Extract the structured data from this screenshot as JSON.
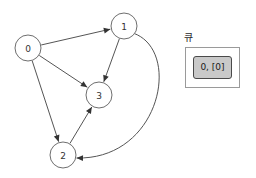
{
  "graph": {
    "directed": true,
    "nodes": [
      {
        "id": "0",
        "label": "0",
        "cx": 28,
        "cy": 48,
        "r": 13
      },
      {
        "id": "1",
        "label": "1",
        "cx": 124,
        "cy": 26,
        "r": 13
      },
      {
        "id": "3",
        "label": "3",
        "cx": 99,
        "cy": 95,
        "r": 13
      },
      {
        "id": "2",
        "label": "2",
        "cx": 63,
        "cy": 155,
        "r": 13
      }
    ],
    "edges": [
      {
        "from": "0",
        "to": "1",
        "curved": false
      },
      {
        "from": "0",
        "to": "3",
        "curved": false
      },
      {
        "from": "0",
        "to": "2",
        "curved": false
      },
      {
        "from": "1",
        "to": "3",
        "curved": false
      },
      {
        "from": "2",
        "to": "3",
        "curved": false
      },
      {
        "from": "1",
        "to": "2",
        "curved": true
      }
    ]
  },
  "queue_panel": {
    "title": "큐",
    "items": [
      {
        "text": "0, [0]"
      }
    ]
  },
  "colors": {
    "background": "#ffffff",
    "node_fill": "#ffffff",
    "node_stroke": "#6f6f6f",
    "node_text": "#333333",
    "edge_stroke": "#555555",
    "arrow_fill": "#333333",
    "panel_border": "#9a9a9a",
    "panel_background": "#ffffff",
    "queue_cell_fill": "#c9c9c9",
    "queue_cell_border": "#4a4a4a",
    "queue_cell_text": "#1a1a1a",
    "title_text": "#2b2b2b"
  }
}
